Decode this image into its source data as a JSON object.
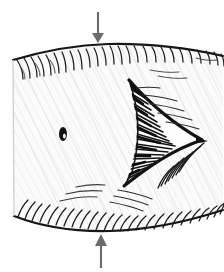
{
  "figure": {
    "medium": "pen-and-ink line drawing",
    "background_color": "#ffffff",
    "ink_color": "#1a1a1a",
    "body_fill_color": "#fafafa",
    "hatch_color": "#c9c9c9",
    "arrow_color": "#6b6b6b",
    "canvas": {
      "width": 224,
      "height": 272
    }
  },
  "annotations": {
    "top_arrow": {
      "name": "compression arrow, top",
      "direction": "down",
      "x": 98,
      "y_start": 12,
      "y_end": 43,
      "color": "#6b6b6b"
    },
    "bottom_arrow": {
      "name": "compression arrow, bottom",
      "direction": "up",
      "x": 101,
      "y_start": 268,
      "y_end": 234,
      "color": "#6b6b6b"
    }
  },
  "shapes": {
    "body": {
      "name": "barrel-shaped body",
      "description": "rounded quadrilateral, convex top and bottom edges",
      "bounds": {
        "x": 12,
        "y": 44,
        "width": 212,
        "height": 190
      }
    },
    "spot": {
      "name": "dark oval spot",
      "cx": 63,
      "cy": 134,
      "rx": 4,
      "ry": 7,
      "color": "#111111"
    },
    "notch": {
      "name": "arrowhead notch",
      "description": "dark chevron / arrowhead shaped cleft opening to the right",
      "apex_x": 202,
      "apex_y": 140,
      "upper_tip_x": 129,
      "upper_tip_y": 80,
      "lower_tip_x": 124,
      "lower_tip_y": 186,
      "color": "#111111"
    }
  },
  "hatching": {
    "top_edge_strokes": 26,
    "bottom_edge_strokes": 28,
    "notch_strokes": 34,
    "interior_texture": "fine diagonal lines, very light"
  }
}
